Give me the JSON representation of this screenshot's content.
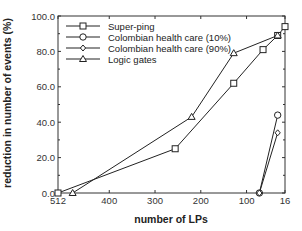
{
  "chart_data": {
    "type": "line",
    "title": "",
    "xlabel": "number of LPs",
    "ylabel": "reduction in number of events (%)",
    "xlim": [
      512,
      16
    ],
    "ylim": [
      0,
      100
    ],
    "x_reversed": true,
    "grid": false,
    "legend_position": "upper left",
    "x_ticks": [
      512,
      400,
      300,
      200,
      100,
      16
    ],
    "x_tick_labels": [
      "512",
      "400",
      "300",
      "200",
      "100",
      "16"
    ],
    "y_ticks": [
      0,
      20,
      40,
      60,
      80,
      100
    ],
    "y_tick_labels": [
      "0.0",
      "20.0",
      "40.0",
      "60.0",
      "80.0",
      "100.0"
    ],
    "series": [
      {
        "name": "Super-ping",
        "marker": "square",
        "x": [
          512,
          256,
          128,
          64,
          32,
          16
        ],
        "y": [
          0,
          25,
          62,
          81,
          89,
          94
        ]
      },
      {
        "name": "Colombian health care (10%)",
        "marker": "circle",
        "x": [
          72,
          32
        ],
        "y": [
          0,
          44
        ]
      },
      {
        "name": "Colombian health care (90%)",
        "marker": "diamond",
        "x": [
          72,
          32
        ],
        "y": [
          0,
          34
        ]
      },
      {
        "name": "Logic gates",
        "marker": "triangle",
        "x": [
          480,
          220,
          128,
          32
        ],
        "y": [
          0,
          43,
          79,
          89
        ]
      }
    ]
  }
}
